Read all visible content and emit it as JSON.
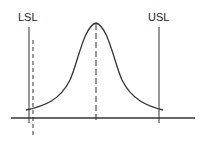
{
  "diagram": {
    "title": "",
    "type": "process-capability-normal-curve",
    "labels": {
      "lower_spec_limit": "LSL",
      "upper_spec_limit": "USL"
    },
    "elements": {
      "curve": "normal-distribution",
      "center_line": "dashed",
      "shifted_line_near_lsl": "dashed",
      "spec_limit_lines": "solid"
    },
    "colors": {
      "line": "#333333",
      "background": "#ffffff"
    }
  }
}
